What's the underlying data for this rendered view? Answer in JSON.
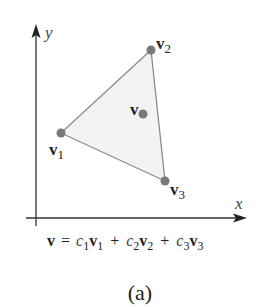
{
  "figure": {
    "caption": "(a)",
    "equation": {
      "lhs": "v",
      "eq": "=",
      "terms": [
        {
          "coef": "c",
          "coef_sub": "1",
          "vec": "v",
          "vec_sub": "1"
        },
        {
          "coef": "c",
          "coef_sub": "2",
          "vec": "v",
          "vec_sub": "2"
        },
        {
          "coef": "c",
          "coef_sub": "3",
          "vec": "v",
          "vec_sub": "3"
        }
      ],
      "plus": "+"
    },
    "axes": {
      "x_label": "x",
      "y_label": "y"
    },
    "points": {
      "v1": {
        "label": "v",
        "sub": "1"
      },
      "v2": {
        "label": "v",
        "sub": "2"
      },
      "v3": {
        "label": "v",
        "sub": "3"
      },
      "v": {
        "label": "v"
      }
    },
    "colors": {
      "axis": "#333333",
      "edge": "#8c8c8c",
      "fill": "#f3f3f3",
      "dot": "#7a7a7a"
    }
  }
}
